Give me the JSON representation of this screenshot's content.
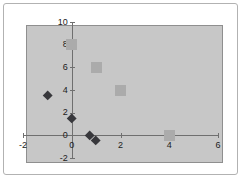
{
  "chart_data": {
    "type": "scatter",
    "title": "",
    "xlabel": "",
    "ylabel": "",
    "grid": false,
    "legend": false,
    "x_axis": {
      "min": -2,
      "max": 6,
      "tick_interval": 2,
      "tick_labels": [
        "-2",
        "0",
        "2",
        "4",
        "6"
      ]
    },
    "y_axis": {
      "min": -2,
      "max": 10,
      "tick_interval": 2,
      "tick_labels": [
        "10",
        "8",
        "6",
        "4",
        "2",
        "0",
        "-2"
      ]
    },
    "series": [
      {
        "name": "square-series",
        "marker": "square",
        "color": "#ababab",
        "points": [
          [
            0,
            8
          ],
          [
            1,
            6
          ],
          [
            2,
            4
          ],
          [
            4,
            0
          ]
        ]
      },
      {
        "name": "diamond-series",
        "marker": "diamond",
        "color": "#38383c",
        "points": [
          [
            -1,
            3.5
          ],
          [
            0,
            1.5
          ],
          [
            0.75,
            0
          ],
          [
            1,
            -0.5
          ]
        ]
      }
    ],
    "colors": {
      "plot_background": "#c7c7c7",
      "plot_border": "#8f8f8f",
      "chart_border": "#b2b2b2",
      "axis_line": "#6f6f6f",
      "label_text": "#1c1c1c",
      "page_background": "#ffffff"
    }
  }
}
